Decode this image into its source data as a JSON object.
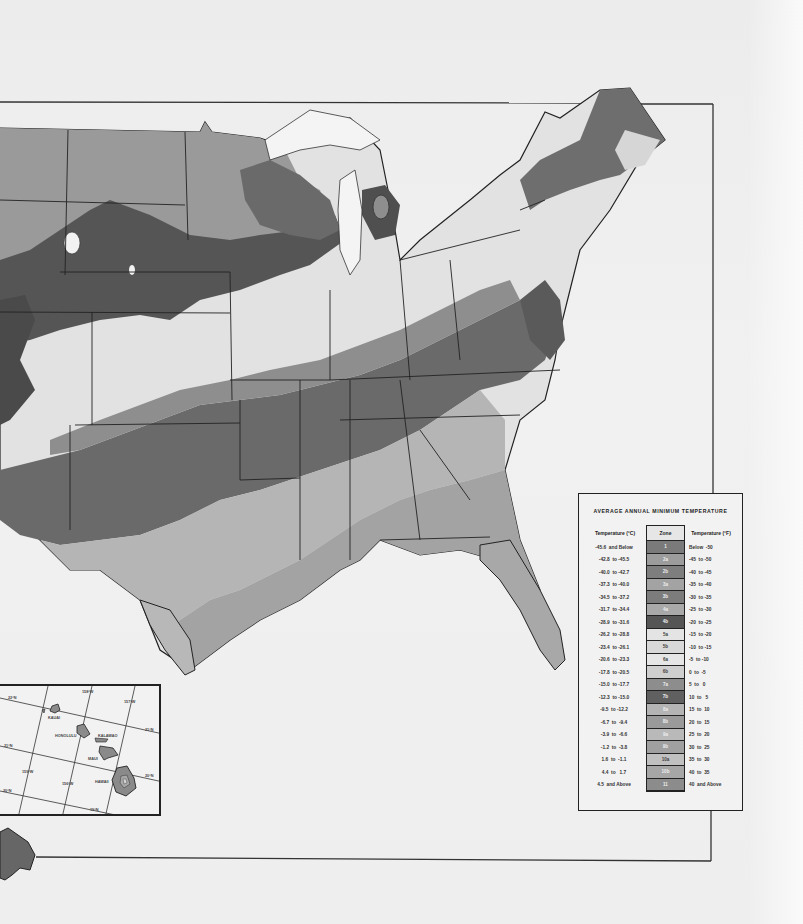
{
  "map": {
    "subject": "Plant hardiness zone map of the contiguous United States",
    "legend": {
      "title": "AVERAGE ANNUAL MINIMUM TEMPERATURE",
      "headers": {
        "celsius": "Temperature (°C)",
        "zone": "Zone",
        "fahrenheit": "Temperature (°F)"
      },
      "rows": [
        {
          "celsius": "-45.6  and Below",
          "zone": "1",
          "fahrenheit": "Below  -50",
          "color": "#7a7a7a"
        },
        {
          "celsius": "-42.8  to -45.5",
          "zone": "2a",
          "fahrenheit": "-45  to -50",
          "color": "#9c9c9c"
        },
        {
          "celsius": "-40.0  to -42.7",
          "zone": "2b",
          "fahrenheit": "-40  to -45",
          "color": "#7e7e7e"
        },
        {
          "celsius": "-37.3  to -40.0",
          "zone": "3a",
          "fahrenheit": "-35  to -40",
          "color": "#a3a3a3"
        },
        {
          "celsius": "-34.5  to -37.2",
          "zone": "3b",
          "fahrenheit": "-30  to -35",
          "color": "#7c7c7c"
        },
        {
          "celsius": "-31.7  to -34.4",
          "zone": "4a",
          "fahrenheit": "-25  to -30",
          "color": "#a9a9a9"
        },
        {
          "celsius": "-28.9  to -31.6",
          "zone": "4b",
          "fahrenheit": "-20  to -25",
          "color": "#555555"
        },
        {
          "celsius": "-26.2  to -28.8",
          "zone": "5a",
          "fahrenheit": "-15  to -20",
          "color": "#e4e4e4"
        },
        {
          "celsius": "-23.4  to -26.1",
          "zone": "5b",
          "fahrenheit": "-10  to -15",
          "color": "#d8d8d8"
        },
        {
          "celsius": "-20.6  to -23.3",
          "zone": "6a",
          "fahrenheit": "-5  to -10",
          "color": "#e6e6e6"
        },
        {
          "celsius": "-17.8  to -20.5",
          "zone": "6b",
          "fahrenheit": "0  to  -5",
          "color": "#cfcfcf"
        },
        {
          "celsius": "-15.0  to -17.7",
          "zone": "7a",
          "fahrenheit": "5  to   0",
          "color": "#8d8d8d"
        },
        {
          "celsius": "-12.3  to -15.0",
          "zone": "7b",
          "fahrenheit": "10  to   5",
          "color": "#606060"
        },
        {
          "celsius": "-9.5  to -12.2",
          "zone": "8a",
          "fahrenheit": "15  to  10",
          "color": "#b4b4b4"
        },
        {
          "celsius": "-6.7  to  -9.4",
          "zone": "8b",
          "fahrenheit": "20  to  15",
          "color": "#9a9a9a"
        },
        {
          "celsius": "-3.9  to  -6.6",
          "zone": "9a",
          "fahrenheit": "25  to  20",
          "color": "#b9b9b9"
        },
        {
          "celsius": "-1.2  to  -3.8",
          "zone": "9b",
          "fahrenheit": "30  to  25",
          "color": "#a0a0a0"
        },
        {
          "celsius": "1.6  to  -1.1",
          "zone": "10a",
          "fahrenheit": "35  to  30",
          "color": "#c0c0c0"
        },
        {
          "celsius": "4.4  to   1.7",
          "zone": "10b",
          "fahrenheit": "40  to  35",
          "color": "#a6a6a6"
        },
        {
          "celsius": "4.5  and Above",
          "zone": "11",
          "fahrenheit": "40  and Above",
          "color": "#8c8c8c"
        }
      ]
    },
    "hawaii_inset": {
      "labels": {
        "kauai": "KAUAI",
        "honolulu": "HONOLULU",
        "kalawao": "KALAWAO",
        "maui": "MAUI",
        "hawaii": "HAWAII"
      },
      "grid_labels": {
        "lat_22": "22°N",
        "lat_21": "21°N",
        "lat_20": "20°N",
        "lat_19": "19°N",
        "lon_159": "159°W",
        "lon_158": "158°W",
        "lon_157": "157°W",
        "lon_156": "156°W",
        "lon_155": "155°W"
      }
    }
  }
}
